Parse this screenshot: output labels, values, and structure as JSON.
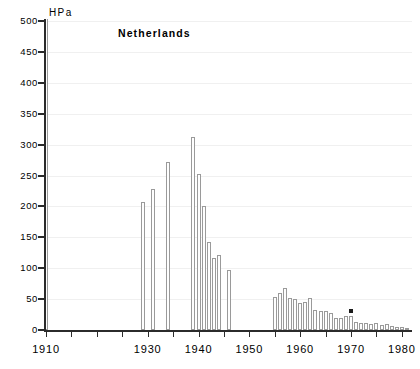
{
  "chart_data": {
    "type": "bar",
    "title": "Netherlands",
    "xlabel": "",
    "ylabel": "HPa",
    "unit_label": "HPa",
    "xlim": [
      1910,
      1982
    ],
    "ylim": [
      0,
      500
    ],
    "grid": true,
    "legend": null,
    "y_ticks": [
      0,
      50,
      100,
      150,
      200,
      250,
      300,
      350,
      400,
      450,
      500
    ],
    "y_tick_labels": [
      "0",
      "50",
      "100",
      "150",
      "200",
      "250",
      "300",
      "350",
      "400",
      "450",
      "500"
    ],
    "x_ticks": [
      1910,
      1915,
      1920,
      1925,
      1930,
      1935,
      1940,
      1945,
      1950,
      1955,
      1960,
      1965,
      1970,
      1975,
      1980
    ],
    "x_tick_labels": [
      "1910",
      "",
      "",
      "",
      "1930",
      "",
      "1940",
      "",
      "1950",
      "",
      "1960",
      "",
      "1970",
      "",
      "1980"
    ],
    "x": [
      1910,
      1929,
      1931,
      1934,
      1939,
      1940,
      1941,
      1942,
      1943,
      1944,
      1946,
      1955,
      1956,
      1957,
      1958,
      1959,
      1960,
      1961,
      1962,
      1963,
      1964,
      1965,
      1966,
      1967,
      1968,
      1969,
      1970,
      1971,
      1972,
      1973,
      1974,
      1975,
      1976,
      1977,
      1978,
      1979,
      1980,
      1981
    ],
    "values": [
      530,
      207,
      228,
      272,
      312,
      252,
      201,
      142,
      117,
      122,
      97,
      54,
      60,
      68,
      52,
      50,
      44,
      46,
      51,
      32,
      31,
      31,
      28,
      19,
      19,
      22,
      22,
      13,
      12,
      11,
      9,
      11,
      8,
      9,
      6,
      5,
      5,
      4
    ],
    "annotations": [
      {
        "x": 1970,
        "y": 22,
        "text": "*",
        "note": "asterisk marker above 1970 bar"
      }
    ]
  },
  "figure": {
    "background_color": "#ffffff",
    "bar_face_color": "#fefefe",
    "bar_edge_color": "#9a9a9a",
    "axis_color": "#2b2b2b",
    "grid_color": "#f0f0f0"
  }
}
